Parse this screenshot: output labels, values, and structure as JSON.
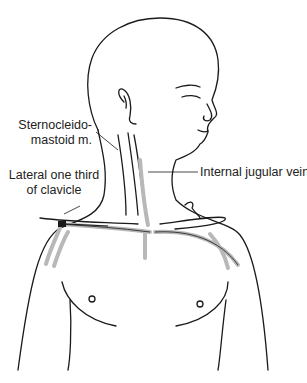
{
  "figure": {
    "type": "anatomical-illustration",
    "colors": {
      "line": "#1a1a1a",
      "vessel": "#b8b8b8",
      "background": "#ffffff"
    }
  },
  "labels": {
    "sternocleidomastoid_line1": "Sternocleido-",
    "sternocleidomastoid_line2": "mastoid m.",
    "lateral_clavicle_line1": "Lateral one third",
    "lateral_clavicle_line2": "of clavicle",
    "internal_jugular": "Internal jugular vein"
  }
}
